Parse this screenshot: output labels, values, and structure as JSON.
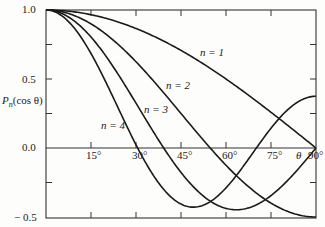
{
  "chart_data": {
    "type": "line",
    "title": "",
    "xlabel": "θ",
    "ylabel": "P_n(cos θ)",
    "xlim": [
      0,
      90
    ],
    "ylim": [
      -0.5,
      1.0
    ],
    "grid": false,
    "legend": "inline labels",
    "x_ticks": [
      "15°",
      "30°",
      "45°",
      "60°",
      "75°",
      "90°"
    ],
    "y_ticks": [
      "1.0",
      "0.5",
      "0.0",
      "− 0.5"
    ],
    "x": [
      0,
      15,
      30,
      45,
      60,
      75,
      90
    ],
    "series": [
      {
        "name": "n = 1",
        "values": [
          1.0,
          0.966,
          0.866,
          0.707,
          0.5,
          0.259,
          0.0
        ]
      },
      {
        "name": "n = 2",
        "values": [
          1.0,
          0.9,
          0.625,
          0.25,
          -0.125,
          -0.4,
          -0.5
        ]
      },
      {
        "name": "n = 3",
        "values": [
          1.0,
          0.804,
          0.325,
          -0.177,
          -0.438,
          -0.302,
          0.0
        ]
      },
      {
        "name": "n = 4",
        "values": [
          1.0,
          0.676,
          -0.023,
          -0.406,
          -0.289,
          0.217,
          0.375
        ]
      }
    ]
  },
  "labels": {
    "y_axis": "P",
    "y_axis_sub": "n",
    "y_axis_rest": "(cos θ)",
    "theta": "θ",
    "n1": "n = 1",
    "n2": "n = 2",
    "n3": "n = 3",
    "n4": "n = 4",
    "y_1": "1.0",
    "y_05": "0.5",
    "y_0": "0.0",
    "y_m05": "− 0.5",
    "x_15": "15°",
    "x_30": "30°",
    "x_45": "45°",
    "x_60": "60°",
    "x_75": "75°",
    "x_90": "90°"
  }
}
